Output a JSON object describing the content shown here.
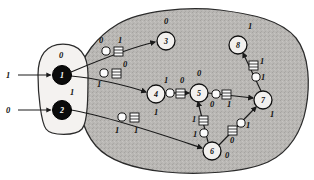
{
  "figure": {
    "regions": {
      "input_oval_name": "input-node-group",
      "network_blob_name": "network-region"
    }
  },
  "inputs": [
    {
      "id": "in1",
      "label": "1",
      "target": "1",
      "x": 8,
      "y": 75
    },
    {
      "id": "in0",
      "label": "0",
      "target": "2",
      "x": 8,
      "y": 110
    }
  ],
  "nodes": [
    {
      "id": "1",
      "label": "1",
      "state": "0",
      "style": "dark",
      "cx": 62,
      "cy": 75,
      "r": 9.5,
      "state_x": 61,
      "state_y": 58
    },
    {
      "id": "2",
      "label": "2",
      "state": "1",
      "style": "dark",
      "cx": 62,
      "cy": 110,
      "r": 9.5,
      "state_x": 72,
      "state_y": 95
    },
    {
      "id": "3",
      "label": "3",
      "state": "0",
      "style": "open",
      "cx": 166,
      "cy": 41,
      "r": 9.0,
      "state_x": 166,
      "state_y": 24
    },
    {
      "id": "4",
      "label": "4",
      "state": "1",
      "style": "open",
      "cx": 156,
      "cy": 94,
      "r": 9.0,
      "state_x": 156,
      "state_y": 115
    },
    {
      "id": "5",
      "label": "5",
      "state": "0",
      "style": "open",
      "cx": 199,
      "cy": 93,
      "r": 9.0,
      "state_x": 199,
      "state_y": 76
    },
    {
      "id": "6",
      "label": "6",
      "state": "0",
      "style": "open",
      "cx": 212,
      "cy": 151,
      "r": 9.0,
      "state_x": 227,
      "state_y": 158
    },
    {
      "id": "7",
      "label": "7",
      "state": "1",
      "style": "open",
      "cx": 263,
      "cy": 100,
      "r": 9.0,
      "state_x": 272,
      "state_y": 117
    },
    {
      "id": "8",
      "label": "8",
      "state": "1",
      "style": "open",
      "cx": 238,
      "cy": 45,
      "r": 9.0,
      "state_x": 250,
      "state_y": 29
    }
  ],
  "edges": [
    {
      "id": "e1-3",
      "from": "1",
      "to": "3",
      "path": "M 71 72 C 95 62 128 48 155 42",
      "circle": {
        "x": 106,
        "y": 51,
        "r": 4.1,
        "label": "0",
        "lx": 101,
        "ly": 43
      },
      "rect": {
        "x": 114,
        "y": 47,
        "w": 9,
        "h": 9,
        "label": "1",
        "lx": 120,
        "ly": 43
      }
    },
    {
      "id": "e1-4",
      "from": "1",
      "to": "4",
      "path": "M 71 76 C 96 78 128 86 146 92",
      "circle": {
        "x": 104,
        "y": 73,
        "r": 4.1,
        "label": "1",
        "lx": 99,
        "ly": 87
      },
      "rect": {
        "x": 112,
        "y": 69,
        "w": 9,
        "h": 9,
        "label": "0",
        "lx": 125,
        "ly": 67
      }
    },
    {
      "id": "e2-6",
      "from": "2",
      "to": "6",
      "path": "M 71 110 C 108 116 166 136 202 148",
      "circle": {
        "x": 122,
        "y": 117,
        "r": 4.1,
        "label": "1",
        "lx": 117,
        "ly": 133
      },
      "rect": {
        "x": 130,
        "y": 113,
        "w": 9,
        "h": 9,
        "label": "1",
        "lx": 136,
        "ly": 133
      }
    },
    {
      "id": "e4-5",
      "from": "4",
      "to": "5",
      "path": "M 165 93 L 189 93",
      "circle": {
        "x": 170,
        "y": 93,
        "r": 4.1,
        "label": "1",
        "lx": 166,
        "ly": 83
      },
      "rect": {
        "x": 176,
        "y": 89,
        "w": 9,
        "h": 9,
        "label": "0",
        "lx": 182,
        "ly": 83
      }
    },
    {
      "id": "e5-7",
      "from": "5",
      "to": "7",
      "path": "M 208 93 L 253 98",
      "circle": {
        "x": 216,
        "y": 94,
        "r": 4.1,
        "label": "0",
        "lx": 212,
        "ly": 107
      },
      "rect": {
        "x": 222,
        "y": 90,
        "w": 9,
        "h": 9,
        "label": "1",
        "lx": 229,
        "ly": 107
      }
    },
    {
      "id": "e6-5",
      "from": "6",
      "to": "5",
      "path": "M 208 142 L 198 102",
      "rect": {
        "x": 199,
        "y": 116,
        "w": 9,
        "h": 9,
        "label": "1",
        "lx": 194,
        "ly": 122
      },
      "circle": {
        "x": 204,
        "y": 133,
        "r": 4.1,
        "label": "1",
        "lx": 195,
        "ly": 137
      }
    },
    {
      "id": "e6-7",
      "from": "6",
      "to": "7",
      "path": "M 219 145 L 256 107",
      "rect": {
        "x": 228,
        "y": 126,
        "w": 9,
        "h": 9,
        "label": "0",
        "lx": 232,
        "ly": 143
      },
      "circle": {
        "x": 241,
        "y": 123,
        "r": 4.1,
        "label": "1",
        "lx": 248,
        "ly": 128
      }
    },
    {
      "id": "e7-8",
      "from": "7",
      "to": "8",
      "path": "M 261 91 L 243 53",
      "rect": {
        "x": 249,
        "y": 61,
        "w": 9,
        "h": 9,
        "label": "1",
        "lx": 262,
        "ly": 64
      },
      "circle": {
        "x": 256,
        "y": 77,
        "r": 4.1,
        "label": "1",
        "lx": 263,
        "ly": 80
      }
    }
  ],
  "shapes": {
    "oval_path": "M 63 44 C 46 44 38 56 38 75 C 38 94 41 122 46 129 C 51 136 76 136 82 129 C 88 122 88 95 88 75 C 88 55 80 44 63 44 Z",
    "blob_path": "M 118 24 C 140 11 186 6 220 10 C 252 14 281 20 296 38 C 310 56 310 86 306 108 C 302 130 290 152 268 162 C 244 173 196 175 166 172 C 136 169 110 162 96 146 C 82 130 76 104 78 80 C 80 56 98 36 118 24 Z"
  }
}
